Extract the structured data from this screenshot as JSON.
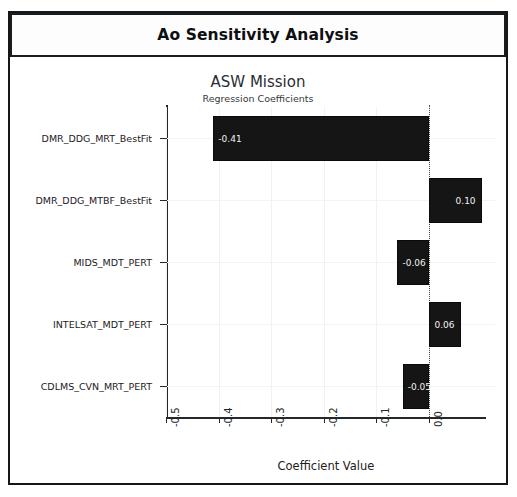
{
  "window": {
    "header_title": "Ao Sensitivity Analysis"
  },
  "chart_data": {
    "type": "bar",
    "orientation": "horizontal",
    "title": "ASW Mission",
    "subtitle": "Regression Coefficients",
    "xlabel": "Coefficient Value",
    "ylabel": "",
    "xlim": [
      -0.5,
      0.0
    ],
    "xticks": [
      "-0.5",
      "-0.4",
      "-0.3",
      "-0.2",
      "-0.1",
      "0.0"
    ],
    "xtick_values": [
      -0.5,
      -0.4,
      -0.3,
      -0.2,
      -0.1,
      0.0
    ],
    "grid": true,
    "legend": "none",
    "zero_reference_line": true,
    "bar_color": "#151515",
    "bar_label_color": "#f2f2f2",
    "categories": [
      "DMR_DDG_MRT_BestFit",
      "DMR_DDG_MTBF_BestFit",
      "MIDS_MDT_PERT",
      "INTELSAT_MDT_PERT",
      "CDLMS_CVN_MRT_PERT"
    ],
    "values": [
      -0.41,
      0.1,
      -0.06,
      0.06,
      -0.05
    ],
    "value_labels": [
      "-0.41",
      "0.10",
      "-0.06",
      "0.06",
      "-0.05"
    ]
  }
}
